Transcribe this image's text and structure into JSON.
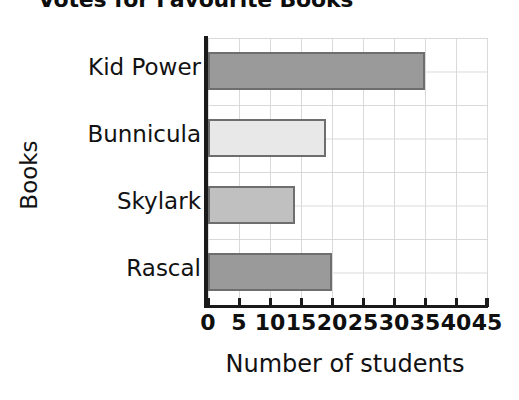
{
  "chart_data": {
    "type": "bar",
    "orientation": "horizontal",
    "title": "Votes for Favourite Books",
    "xlabel": "Number of students",
    "ylabel": "Books",
    "categories": [
      "Kid Power",
      "Bunnicula",
      "Skylark",
      "Rascal"
    ],
    "values": [
      35,
      19,
      14,
      20
    ],
    "series": [
      {
        "name": "Votes",
        "values": [
          35,
          19,
          14,
          20
        ]
      }
    ],
    "xlim": [
      0,
      45
    ],
    "xticks": [
      "0",
      "5",
      "10",
      "15",
      "20",
      "25",
      "30",
      "35",
      "40",
      "45"
    ],
    "xtick_values": [
      0,
      5,
      10,
      15,
      20,
      25,
      30,
      35,
      40,
      45
    ],
    "grid": true,
    "legend": false,
    "bar_colors": [
      "#9a9a9a",
      "#e8e8e8",
      "#c0c0c0",
      "#9a9a9a"
    ],
    "bar_border_color": "#6e6e6e",
    "grid_color": "#d9d9d9",
    "axis_color": "#1a1a1a",
    "background": "#ffffff"
  }
}
